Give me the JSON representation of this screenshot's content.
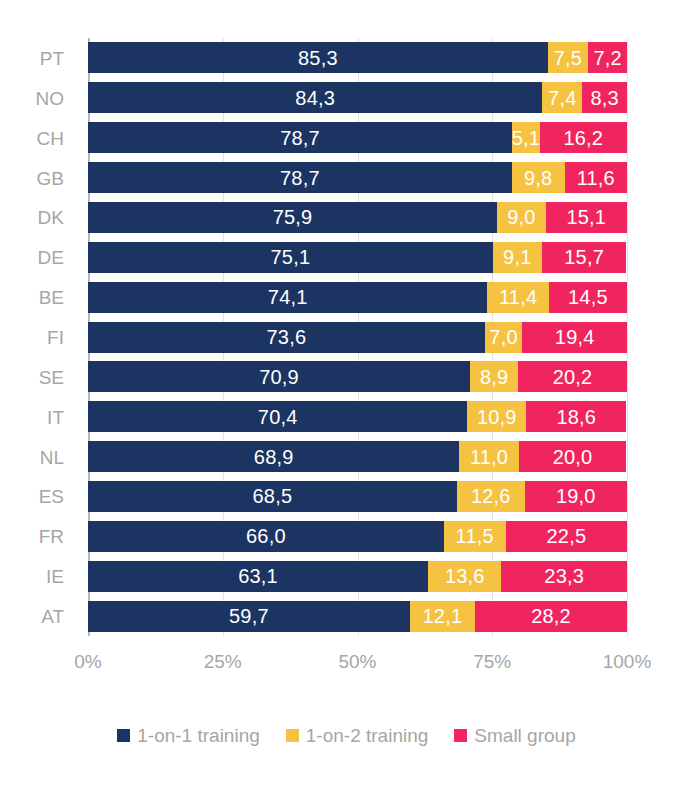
{
  "chart_data": {
    "type": "bar",
    "orientation": "horizontal",
    "stacked": true,
    "stack_mode": "percent",
    "title": "",
    "subtitle": "",
    "xlabel": "",
    "ylabel": "",
    "xlim": [
      0,
      100
    ],
    "xticks": [
      "0%",
      "25%",
      "50%",
      "75%",
      "100%"
    ],
    "xtick_values": [
      0,
      25,
      50,
      75,
      100
    ],
    "grid": true,
    "grid_axis": "x",
    "legend_position": "bottom",
    "categories": [
      "PT",
      "NO",
      "CH",
      "GB",
      "DK",
      "DE",
      "BE",
      "FI",
      "SE",
      "IT",
      "NL",
      "ES",
      "FR",
      "IE",
      "AT"
    ],
    "series": [
      {
        "name": "1-on-1 training",
        "color": "#1B3461",
        "values": [
          85.3,
          84.3,
          78.7,
          78.7,
          75.9,
          75.1,
          74.1,
          73.6,
          70.9,
          70.4,
          68.9,
          68.5,
          66.0,
          63.1,
          59.7
        ],
        "labels": [
          "85,3",
          "84,3",
          "78,7",
          "78,7",
          "75,9",
          "75,1",
          "74,1",
          "73,6",
          "70,9",
          "70,4",
          "68,9",
          "68,5",
          "66,0",
          "63,1",
          "59,7"
        ]
      },
      {
        "name": "1-on-2 training",
        "color": "#F5C242",
        "values": [
          7.5,
          7.4,
          5.1,
          9.8,
          9.0,
          9.1,
          11.4,
          7.0,
          8.9,
          10.9,
          11.0,
          12.6,
          11.5,
          13.6,
          12.1
        ],
        "labels": [
          "7,5",
          "7,4",
          "5,1",
          "9,8",
          "9,0",
          "9,1",
          "11,4",
          "7,0",
          "8,9",
          "10,9",
          "11,0",
          "12,6",
          "11,5",
          "13,6",
          "12,1"
        ]
      },
      {
        "name": "Small group",
        "color": "#F0255F",
        "values": [
          7.2,
          8.3,
          16.2,
          11.6,
          15.1,
          15.7,
          14.5,
          19.4,
          20.2,
          18.6,
          20.0,
          19.0,
          22.5,
          23.3,
          28.2
        ],
        "labels": [
          "7,2",
          "8,3",
          "16,2",
          "11,6",
          "15,1",
          "15,7",
          "14,5",
          "19,4",
          "20,2",
          "18,6",
          "20,0",
          "19,0",
          "22,5",
          "23,3",
          "28,2"
        ]
      }
    ]
  },
  "style": {
    "label_color": "#a6a6a6",
    "gridline_color": "#e3e3e3",
    "axis_color": "#b9b7b0",
    "value_label_color": "#ffffff",
    "background": "#ffffff"
  }
}
